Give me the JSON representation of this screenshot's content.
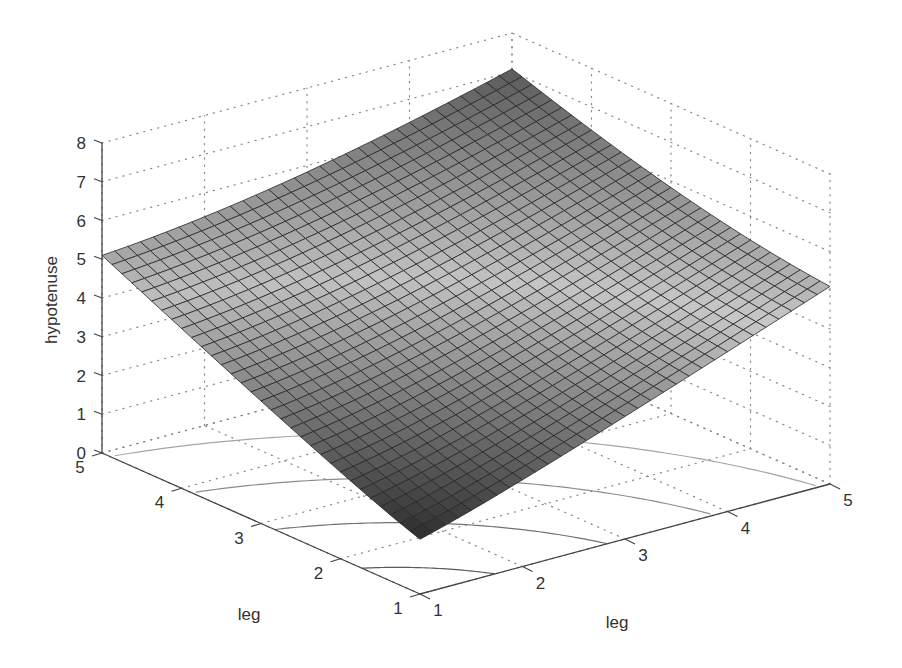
{
  "chart_data": {
    "type": "surface",
    "subtype": "surfc (surface with floor contours)",
    "title": "",
    "function": "hypotenuse = sqrt(leg1^2 + leg2^2)",
    "xlabel": "leg",
    "ylabel": "leg",
    "zlabel": "hypotenuse",
    "xlim": [
      1,
      5
    ],
    "ylim": [
      1,
      5
    ],
    "zlim": [
      0,
      8
    ],
    "x_ticks": [
      "1",
      "2",
      "3",
      "4",
      "5"
    ],
    "y_ticks": [
      "1",
      "2",
      "3",
      "4",
      "5"
    ],
    "z_ticks": [
      "0",
      "1",
      "2",
      "3",
      "4",
      "5",
      "6",
      "7",
      "8"
    ],
    "grid": "dotted",
    "colormap": "gray",
    "mesh_resolution": 33,
    "contour_levels": [
      2,
      3,
      4,
      5,
      6,
      7
    ],
    "corner_values": {
      "leg1_1_leg2_1": 1.41,
      "leg1_5_leg2_1": 5.1,
      "leg1_1_leg2_5": 5.1,
      "leg1_5_leg2_5": 7.07
    },
    "projection": {
      "origin_px": [
        420,
        594
      ],
      "x_unit_px": [
        102.5,
        -27.5
      ],
      "y_unit_px": [
        -79.5,
        -35.25
      ],
      "z_unit_px": [
        0,
        -38.75
      ]
    }
  }
}
